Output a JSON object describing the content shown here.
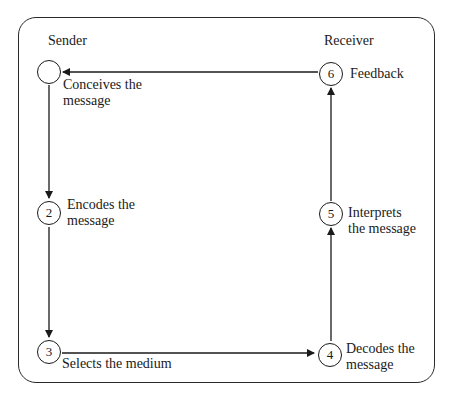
{
  "diagram": {
    "headings": {
      "sender": "Sender",
      "receiver": "Receiver"
    },
    "nodes": [
      {
        "id": 1,
        "number": "",
        "label_line1": "Conceives the",
        "label_line2": "message",
        "side": "sender"
      },
      {
        "id": 2,
        "number": "2",
        "label_line1": "Encodes the",
        "label_line2": "message",
        "side": "sender"
      },
      {
        "id": 3,
        "number": "3",
        "label_line1": "Selects the medium",
        "label_line2": "",
        "side": "sender"
      },
      {
        "id": 4,
        "number": "4",
        "label_line1": "Decodes the",
        "label_line2": "message",
        "side": "receiver"
      },
      {
        "id": 5,
        "number": "5",
        "label_line1": "Interprets",
        "label_line2": "the message",
        "side": "receiver"
      },
      {
        "id": 6,
        "number": "6",
        "label_line1": "Feedback",
        "label_line2": "",
        "side": "receiver"
      }
    ],
    "edges": [
      {
        "from": 1,
        "to": 2
      },
      {
        "from": 2,
        "to": 3
      },
      {
        "from": 3,
        "to": 4
      },
      {
        "from": 4,
        "to": 5
      },
      {
        "from": 5,
        "to": 6
      },
      {
        "from": 6,
        "to": 1
      }
    ],
    "colors": {
      "stroke": "#1a1a1a",
      "background": "#ffffff"
    }
  }
}
